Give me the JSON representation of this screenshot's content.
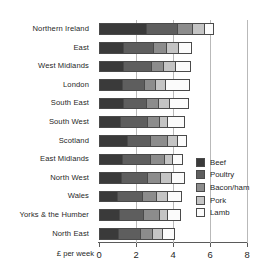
{
  "chart_data": {
    "type": "bar",
    "orientation": "horizontal",
    "stacked": true,
    "title": "",
    "xlabel": "£ per week",
    "ylabel": "",
    "xlim": [
      0,
      8
    ],
    "xticks": [
      0,
      2,
      4,
      6,
      8
    ],
    "xtick_labels": [
      "0",
      "2",
      "4",
      "6",
      "8"
    ],
    "grid": true,
    "grid_axis": "x",
    "legend_position": "right-inside",
    "categories": [
      "Northern Ireland",
      "East",
      "West Midlands",
      "London",
      "South East",
      "South West",
      "Scotland",
      "East Midlands",
      "North West",
      "Wales",
      "Yorks & the Humber",
      "North East"
    ],
    "series": [
      {
        "name": "Beef",
        "color": "#3a3a3a",
        "values": [
          2.6,
          1.35,
          1.3,
          1.25,
          1.3,
          1.15,
          1.55,
          1.3,
          1.2,
          1.0,
          1.1,
          1.05
        ]
      },
      {
        "name": "Poultry",
        "color": "#5e5e5e",
        "values": [
          1.7,
          1.65,
          1.55,
          1.25,
          1.3,
          1.5,
          1.25,
          1.55,
          1.45,
          1.4,
          1.35,
          1.2
        ]
      },
      {
        "name": "Bacon/ham",
        "color": "#8c8c8c",
        "values": [
          0.8,
          0.7,
          0.7,
          0.6,
          0.65,
          0.65,
          0.95,
          0.75,
          0.75,
          0.75,
          0.85,
          0.7
        ]
      },
      {
        "name": "Pork",
        "color": "#c4c4c4",
        "values": [
          0.7,
          0.65,
          0.65,
          0.55,
          0.6,
          0.45,
          0.55,
          0.45,
          0.6,
          0.6,
          0.45,
          0.55
        ]
      },
      {
        "name": "Lamb",
        "color": "#fbfbfb",
        "values": [
          0.4,
          0.65,
          0.75,
          1.25,
          1.0,
          0.9,
          0.45,
          0.5,
          0.65,
          0.75,
          0.7,
          0.6
        ]
      }
    ],
    "totals": [
      6.2,
      5.0,
      4.95,
      4.9,
      4.85,
      4.65,
      4.75,
      4.55,
      4.65,
      4.5,
      4.45,
      4.1
    ]
  },
  "legend": {
    "items": [
      {
        "label": "Beef"
      },
      {
        "label": "Poultry"
      },
      {
        "label": "Bacon/ham"
      },
      {
        "label": "Pork"
      },
      {
        "label": "Lamb"
      }
    ]
  }
}
